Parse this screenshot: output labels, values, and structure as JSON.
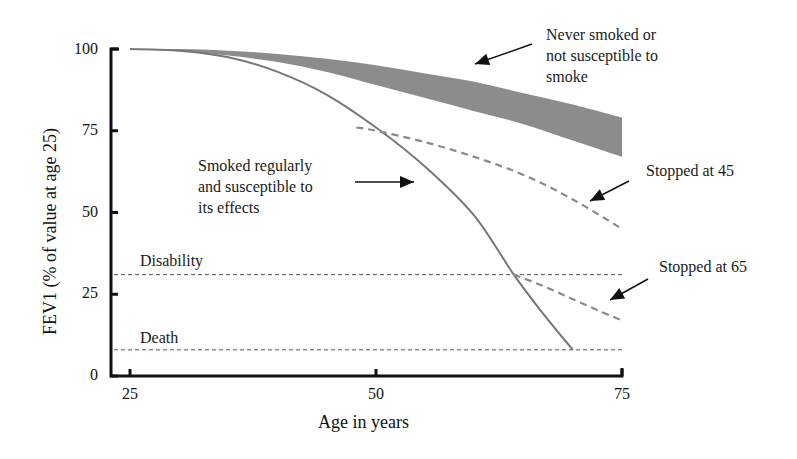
{
  "chart_data": {
    "type": "line",
    "title": "",
    "xlabel": "Age in years",
    "ylabel": "FEV1 (% of value at age 25)",
    "xlim": [
      25,
      75
    ],
    "ylim": [
      0,
      100
    ],
    "x_ticks": [
      "25",
      "50",
      "75"
    ],
    "y_ticks": [
      "0",
      "25",
      "50",
      "75",
      "100"
    ],
    "grid": false,
    "legend": "none (annotated with arrows)",
    "series": [
      {
        "name": "Never smoked or not susceptible to smoke",
        "style": "shaded band",
        "x": [
          25,
          30,
          35,
          40,
          45,
          50,
          55,
          60,
          65,
          70,
          75
        ],
        "upper": [
          100,
          100,
          99.5,
          98.5,
          97,
          95,
          92.5,
          90,
          86.5,
          83,
          79
        ],
        "lower": [
          100,
          99.5,
          98,
          96,
          93,
          89,
          85,
          81,
          77,
          72,
          67
        ]
      },
      {
        "name": "Smoked regularly and susceptible to its effects",
        "style": "solid line",
        "x": [
          25,
          30,
          35,
          40,
          45,
          50,
          55,
          60,
          64,
          67,
          70
        ],
        "values": [
          100,
          99.5,
          97.5,
          93,
          86,
          76,
          64,
          49,
          31,
          19,
          8
        ]
      },
      {
        "name": "Stopped at 45",
        "style": "dashed line",
        "x": [
          48,
          50,
          55,
          60,
          65,
          70,
          75
        ],
        "values": [
          76,
          75,
          71.5,
          67,
          61.5,
          54,
          45
        ]
      },
      {
        "name": "Stopped at 65",
        "style": "dashed line",
        "x": [
          64,
          67,
          70,
          73,
          75
        ],
        "values": [
          31,
          27.5,
          23.5,
          19.5,
          17
        ]
      }
    ],
    "reference_lines": [
      {
        "label": "Disability",
        "y": 31,
        "style": "dotted"
      },
      {
        "label": "Death",
        "y": 8,
        "style": "dotted"
      }
    ],
    "annotations": [
      {
        "text": "Never smoked or not susceptible to smoke",
        "points_to": "band"
      },
      {
        "text": "Smoked regularly and susceptible to its effects",
        "points_to": "smoker curve"
      },
      {
        "text": "Stopped at 45",
        "points_to": "stopped-45 curve"
      },
      {
        "text": "Stopped at 65",
        "points_to": "stopped-65 curve"
      }
    ],
    "colors": {
      "band": "#8c8c8c",
      "line": "#777777",
      "axis": "#111111",
      "reference": "#555555"
    }
  },
  "labels": {
    "never_smoked": [
      "Never smoked or",
      "not susceptible to",
      "smoke"
    ],
    "smoked": [
      "Smoked regularly",
      "and susceptible to",
      "its effects"
    ],
    "stopped45": "Stopped at 45",
    "stopped65": "Stopped at 65",
    "disability": "Disability",
    "death": "Death"
  }
}
